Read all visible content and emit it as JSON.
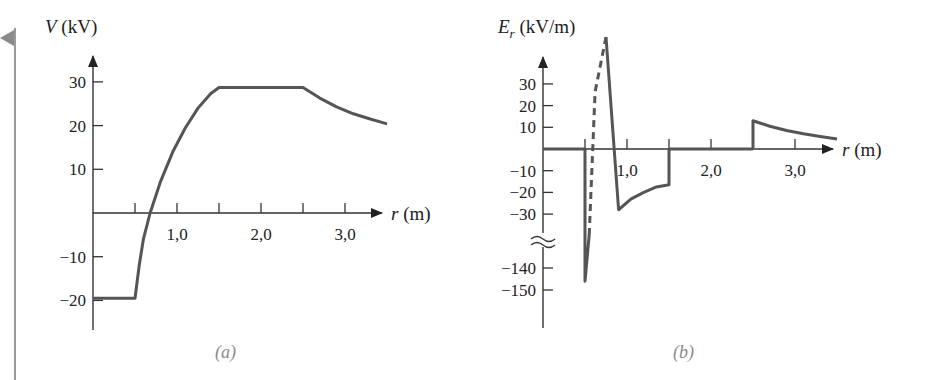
{
  "chart_data": [
    {
      "id": "a",
      "type": "line",
      "panel_label": "(a)",
      "title": "",
      "ylabel_var": "V",
      "ylabel_unit": " (kV)",
      "xlabel_var": "r",
      "xlabel_unit": " (m)",
      "x_ticks": [
        0.5,
        1.0,
        1.5,
        2.0,
        2.5,
        3.0
      ],
      "x_tick_labels": [
        "",
        "1,0",
        "",
        "2,0",
        "",
        "3,0"
      ],
      "y_ticks": [
        30,
        20,
        10,
        -10,
        -20
      ],
      "y_tick_labels": [
        "30",
        "20",
        "10",
        "−10",
        "−20"
      ],
      "xlim": [
        0,
        3.5
      ],
      "ylim": [
        -27,
        35
      ],
      "grid": false,
      "series": [
        {
          "name": "V(r)",
          "x": [
            0,
            0.5,
            0.55,
            0.6,
            0.68,
            0.8,
            0.95,
            1.1,
            1.25,
            1.4,
            1.5,
            2.5,
            2.7,
            2.9,
            3.1,
            3.3,
            3.5
          ],
          "y": [
            -19.5,
            -19.5,
            -12,
            -6,
            0,
            7,
            14,
            19.5,
            24,
            27.3,
            28.7,
            28.7,
            26.3,
            24.3,
            22.7,
            21.5,
            20.4
          ],
          "style": "solid"
        }
      ]
    },
    {
      "id": "b",
      "type": "line",
      "panel_label": "(b)",
      "title": "",
      "ylabel_var": "E",
      "ylabel_sub": "r",
      "ylabel_unit": " (kV/m)",
      "xlabel_var": "r",
      "xlabel_unit": " (m)",
      "x_ticks": [
        0.5,
        1.0,
        1.5,
        2.0,
        2.5,
        3.0
      ],
      "x_tick_labels": [
        "",
        "1,0",
        "",
        "2,0",
        "",
        "3,0"
      ],
      "y_ticks": [
        30,
        20,
        10,
        -10,
        -20,
        -30,
        -140,
        -150
      ],
      "y_tick_labels": [
        "30",
        "20",
        "10",
        "−10",
        "−20",
        "−30",
        "−140",
        "−150"
      ],
      "axis_break": "between -30 and -140",
      "xlim": [
        0,
        3.5
      ],
      "ylim": [
        -160,
        35
      ],
      "grid": false,
      "series": [
        {
          "name": "E_r (r<0.5)",
          "x": [
            0,
            0.5
          ],
          "y": [
            0,
            0
          ],
          "style": "solid"
        },
        {
          "name": "E_r (0.5<r<1.5)",
          "x": [
            0.5,
            0.5,
            0.55,
            0.62,
            0.75,
            0.9,
            1.05,
            1.2,
            1.35,
            1.5,
            1.5
          ],
          "y": [
            0,
            -146,
            -125,
            -60,
            -35,
            -28,
            -23,
            -20,
            -17.5,
            -16.5,
            0
          ],
          "style": "solid with dashed middle segment"
        },
        {
          "name": "E_r (1.5<r<2.5)",
          "x": [
            1.5,
            2.5
          ],
          "y": [
            0,
            0
          ],
          "style": "solid"
        },
        {
          "name": "E_r (r>2.5)",
          "x": [
            2.5,
            2.5,
            2.7,
            2.9,
            3.1,
            3.3,
            3.5
          ],
          "y": [
            0,
            13,
            10.5,
            8.5,
            7,
            5.8,
            4.6
          ],
          "style": "solid"
        }
      ]
    }
  ]
}
